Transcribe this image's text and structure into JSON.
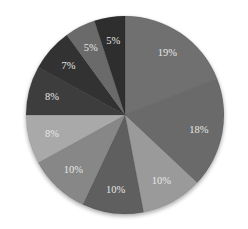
{
  "chart_data": {
    "type": "pie",
    "title": "",
    "start_angle_deg": 0,
    "direction": "clockwise",
    "legend": "none",
    "slices": [
      {
        "label": "19%",
        "value": 19,
        "color": "#6f6f6f"
      },
      {
        "label": "18%",
        "value": 18,
        "color": "#6a6a6a"
      },
      {
        "label": "10%",
        "value": 10,
        "color": "#9a9a9a"
      },
      {
        "label": "10%",
        "value": 10,
        "color": "#5e5e5e"
      },
      {
        "label": "10%",
        "value": 10,
        "color": "#878787"
      },
      {
        "label": "8%",
        "value": 8,
        "color": "#a9a9a9"
      },
      {
        "label": "8%",
        "value": 8,
        "color": "#3e3e3e"
      },
      {
        "label": "7%",
        "value": 7,
        "color": "#333333"
      },
      {
        "label": "5%",
        "value": 5,
        "color": "#6b6b6b"
      },
      {
        "label": "5%",
        "value": 5,
        "color": "#2e2e2e"
      }
    ]
  },
  "layout": {
    "cx": 125,
    "cy": 115,
    "r": 99,
    "label_radius_ratio": 0.76
  }
}
